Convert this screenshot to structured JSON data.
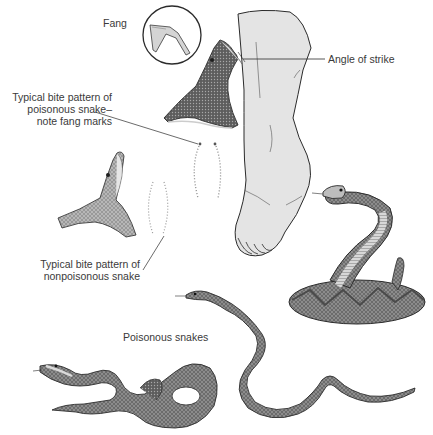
{
  "figure": {
    "colors": {
      "background": "#ffffff",
      "ink": "#2b2b2b",
      "label_text": "#3a3a3a",
      "foot_fill": "#e4e4e4",
      "snake_dark": "#6e6e6e",
      "snake_mid": "#9a9a9a",
      "snake_light": "#c9c9c9",
      "bite_dots": "#8a8a8a"
    },
    "labels": {
      "fang": "Fang",
      "angle_of_strike": "Angle of strike",
      "poisonous_bite_line1": "Typical bite pattern of",
      "poisonous_bite_line2": "poisonous snake–",
      "poisonous_bite_line3": "note fang marks",
      "nonpoisonous_bite_line1": "Typical bite pattern of",
      "nonpoisonous_bite_line2": "nonpoisonous snake",
      "poisonous_snakes": "Poisonous snakes"
    },
    "illustrations": [
      "fang-inset-circle",
      "pit-viper-head-striking",
      "human-foot",
      "poisonous-bite-pattern",
      "nonpoisonous-snake-head",
      "nonpoisonous-bite-pattern",
      "coiled-rattlesnake",
      "crawling-snake-left",
      "crawling-snake-center"
    ]
  }
}
